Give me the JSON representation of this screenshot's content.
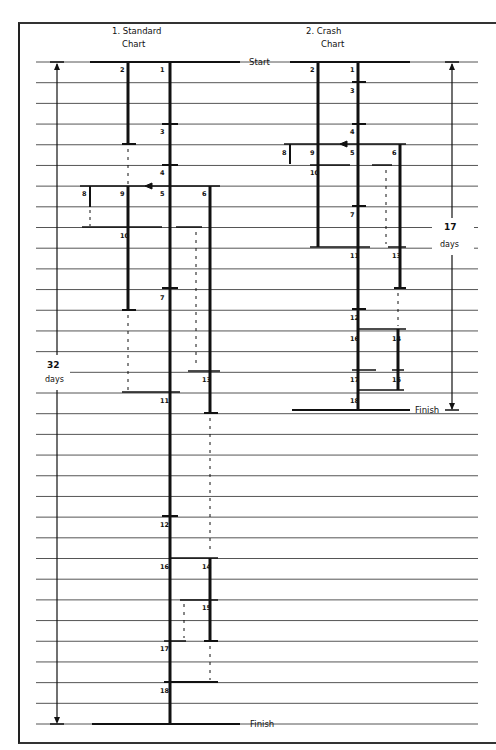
{
  "charts": {
    "standard": {
      "title_line1": "1. Standard",
      "title_line2": "Chart",
      "duration_number": "32",
      "duration_unit": "days"
    },
    "crash": {
      "title_line1": "2. Crash",
      "title_line2": "Chart",
      "duration_number": "17",
      "duration_unit": "days"
    }
  },
  "labels": {
    "start": "Start",
    "finish": "Finish"
  },
  "grid": {
    "row_count": 32,
    "top_y": 62,
    "bottom_y": 724,
    "left_x": 36,
    "right_x": 478
  },
  "standard_nodes": [
    {
      "id": "1",
      "x": 168,
      "row": 0
    },
    {
      "id": "2",
      "x": 128,
      "row": 0
    },
    {
      "id": "3",
      "x": 168,
      "row": 3
    },
    {
      "id": "4",
      "x": 168,
      "row": 5
    },
    {
      "id": "5",
      "x": 168,
      "row": 6
    },
    {
      "id": "6",
      "x": 210,
      "row": 6
    },
    {
      "id": "8",
      "x": 90,
      "row": 6
    },
    {
      "id": "9",
      "x": 128,
      "row": 6
    },
    {
      "id": "10",
      "x": 128,
      "row": 8
    },
    {
      "id": "7",
      "x": 168,
      "row": 11
    },
    {
      "id": "13",
      "x": 210,
      "row": 15
    },
    {
      "id": "11",
      "x": 168,
      "row": 16
    },
    {
      "id": "12",
      "x": 168,
      "row": 22
    },
    {
      "id": "16",
      "x": 168,
      "row": 24
    },
    {
      "id": "14",
      "x": 210,
      "row": 24
    },
    {
      "id": "15",
      "x": 210,
      "row": 26
    },
    {
      "id": "17",
      "x": 168,
      "row": 28
    },
    {
      "id": "18",
      "x": 168,
      "row": 30
    }
  ],
  "crash_nodes": [
    {
      "id": "1",
      "x": 358,
      "row": 0
    },
    {
      "id": "2",
      "x": 318,
      "row": 0
    },
    {
      "id": "3",
      "x": 358,
      "row": 1
    },
    {
      "id": "4",
      "x": 358,
      "row": 3
    },
    {
      "id": "5",
      "x": 358,
      "row": 4
    },
    {
      "id": "6",
      "x": 400,
      "row": 4
    },
    {
      "id": "8",
      "x": 290,
      "row": 4
    },
    {
      "id": "9",
      "x": 318,
      "row": 4
    },
    {
      "id": "10",
      "x": 318,
      "row": 5
    },
    {
      "id": "7",
      "x": 358,
      "row": 7
    },
    {
      "id": "11",
      "x": 358,
      "row": 9
    },
    {
      "id": "13",
      "x": 400,
      "row": 9
    },
    {
      "id": "12",
      "x": 358,
      "row": 12
    },
    {
      "id": "16",
      "x": 358,
      "row": 13
    },
    {
      "id": "14",
      "x": 400,
      "row": 13
    },
    {
      "id": "17",
      "x": 358,
      "row": 15
    },
    {
      "id": "15",
      "x": 400,
      "row": 15
    },
    {
      "id": "18",
      "x": 358,
      "row": 16
    }
  ]
}
